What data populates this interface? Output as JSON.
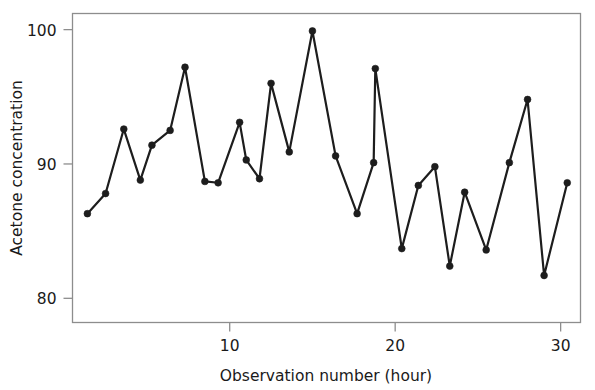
{
  "chart_data": {
    "type": "line",
    "title": "",
    "subtitle": "",
    "xlabel": "Observation number (hour)",
    "ylabel": "Acetone concentration",
    "xlim": [
      0.5,
      31.2
    ],
    "ylim": [
      78.2,
      101.2
    ],
    "xticks": [
      10,
      20,
      30
    ],
    "xticklabels": [
      "10",
      "20",
      "30"
    ],
    "yticks": [
      80,
      90,
      100
    ],
    "yticklabels": [
      "80",
      "90",
      "100"
    ],
    "grid": false,
    "legend": null,
    "marker": "circle",
    "line_color": "#1d1d1d",
    "marker_color": "#1d1d1d",
    "frame_color": "#8d8d8d",
    "background_color": "#ffffff",
    "x": [
      1,
      2,
      3,
      4,
      5,
      6,
      7,
      8,
      9,
      10,
      11,
      12,
      13,
      14,
      15,
      16,
      17,
      18,
      19,
      20,
      21,
      22,
      23,
      24,
      25,
      26,
      27,
      28,
      29,
      30
    ],
    "values": [
      86.3,
      87.8,
      92.6,
      88.8,
      91.4,
      92.5,
      97.2,
      88.7,
      88.6,
      93.1,
      90.3,
      88.9,
      96.0,
      90.9,
      99.9,
      90.6,
      86.3,
      90.1,
      97.1,
      83.7,
      88.4,
      89.8,
      82.4,
      87.9,
      83.6,
      90.1,
      94.8,
      81.7,
      88.6,
      88.6
    ],
    "series": [
      {
        "name": "Acetone concentration",
        "points": [
          {
            "x": 1.4,
            "y": 86.3
          },
          {
            "x": 2.5,
            "y": 87.8
          },
          {
            "x": 3.6,
            "y": 92.6
          },
          {
            "x": 4.6,
            "y": 88.8
          },
          {
            "x": 5.3,
            "y": 91.4
          },
          {
            "x": 6.4,
            "y": 92.5
          },
          {
            "x": 7.3,
            "y": 97.2
          },
          {
            "x": 8.5,
            "y": 88.7
          },
          {
            "x": 9.3,
            "y": 88.6
          },
          {
            "x": 10.6,
            "y": 93.1
          },
          {
            "x": 11.0,
            "y": 90.3
          },
          {
            "x": 11.8,
            "y": 88.9
          },
          {
            "x": 12.5,
            "y": 96.0
          },
          {
            "x": 13.6,
            "y": 90.9
          },
          {
            "x": 15.0,
            "y": 99.9
          },
          {
            "x": 16.4,
            "y": 90.6
          },
          {
            "x": 17.7,
            "y": 86.3
          },
          {
            "x": 18.7,
            "y": 90.1
          },
          {
            "x": 18.8,
            "y": 97.1
          },
          {
            "x": 20.4,
            "y": 83.7
          },
          {
            "x": 21.4,
            "y": 88.4
          },
          {
            "x": 22.4,
            "y": 89.8
          },
          {
            "x": 23.3,
            "y": 82.4
          },
          {
            "x": 24.2,
            "y": 87.9
          },
          {
            "x": 25.5,
            "y": 83.6
          },
          {
            "x": 26.9,
            "y": 90.1
          },
          {
            "x": 28.0,
            "y": 94.8
          },
          {
            "x": 29.0,
            "y": 81.7
          },
          {
            "x": 30.4,
            "y": 88.6
          }
        ]
      }
    ]
  },
  "axes": {
    "x_title": "Observation number (hour)",
    "y_title": "Acetone concentration"
  }
}
